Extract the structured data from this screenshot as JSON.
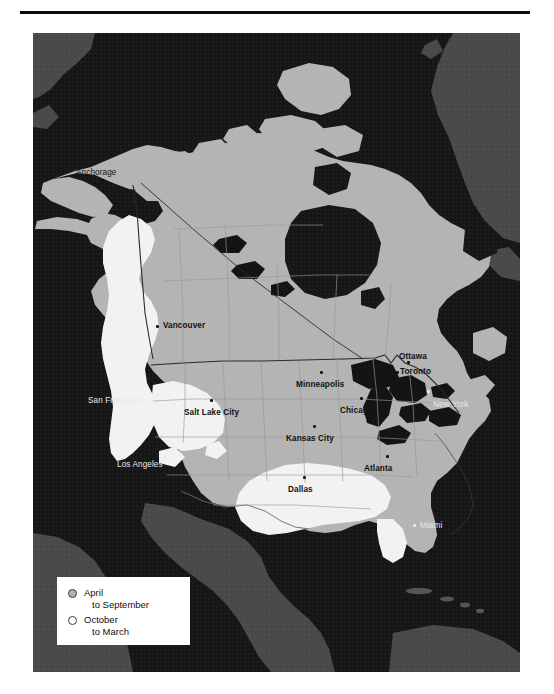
{
  "page": {
    "background_color": "#ffffff",
    "rule_color": "#0b0b0b"
  },
  "map": {
    "projection_note": "North America",
    "colors": {
      "ocean": "#171717",
      "land_other": "#4a4a4a",
      "land_main": "#b4b4b4",
      "season_april_september": "#b4b4b4",
      "season_october_march": "#f2f2f2",
      "lakes": "#141414",
      "border_line": "#2a2a2a",
      "state_line": "#9a9a9a"
    },
    "cities": [
      {
        "name": "Anchorage",
        "x": 76,
        "y": 168,
        "dot_x": 101,
        "dot_y": 179,
        "style": "on-land",
        "weight": "plainish"
      },
      {
        "name": "Vancouver",
        "x": 163,
        "y": 321,
        "dot_x": 156,
        "dot_y": 325,
        "style": "on-land",
        "weight": "bold"
      },
      {
        "name": "San Francisco",
        "x": 88,
        "y": 396,
        "dot_x": 156,
        "dot_y": 394,
        "style": "on-water",
        "weight": "plainish"
      },
      {
        "name": "Los Angeles",
        "x": 117,
        "y": 460,
        "dot_x": 163,
        "dot_y": 455,
        "style": "on-water",
        "weight": "plainish"
      },
      {
        "name": "Salt Lake City",
        "x": 184,
        "y": 408,
        "dot_x": 210,
        "dot_y": 399,
        "style": "on-land",
        "weight": "bold"
      },
      {
        "name": "Minneapolis",
        "x": 296,
        "y": 380,
        "dot_x": 320,
        "dot_y": 371,
        "style": "on-land",
        "weight": "bold"
      },
      {
        "name": "Chicago",
        "x": 340,
        "y": 406,
        "dot_x": 360,
        "dot_y": 397,
        "style": "on-land",
        "weight": "bold"
      },
      {
        "name": "Kansas City",
        "x": 286,
        "y": 434,
        "dot_x": 313,
        "dot_y": 425,
        "style": "on-land",
        "weight": "bold"
      },
      {
        "name": "Dallas",
        "x": 288,
        "y": 485,
        "dot_x": 303,
        "dot_y": 476,
        "style": "on-land",
        "weight": "bold"
      },
      {
        "name": "Atlanta",
        "x": 364,
        "y": 464,
        "dot_x": 386,
        "dot_y": 455,
        "style": "on-land",
        "weight": "bold"
      },
      {
        "name": "Ottawa",
        "x": 399,
        "y": 352,
        "dot_x": 407,
        "dot_y": 361,
        "style": "on-land",
        "weight": "bold"
      },
      {
        "name": "Toronto",
        "x": 400,
        "y": 367,
        "dot_x": 396,
        "dot_y": 371,
        "style": "on-land",
        "weight": "bold"
      },
      {
        "name": "New York",
        "x": 433,
        "y": 400,
        "dot_x": 427,
        "dot_y": 390,
        "style": "on-water",
        "weight": "plainish"
      },
      {
        "name": "Miami",
        "x": 420,
        "y": 521,
        "dot_x": 413,
        "dot_y": 524,
        "style": "on-water",
        "weight": "plainish"
      }
    ]
  },
  "legend": {
    "items": [
      {
        "swatch": "filled",
        "swatch_color": "#b3b3b3",
        "line1": "April",
        "line2": "to September"
      },
      {
        "swatch": "hollow",
        "swatch_color": "#ffffff",
        "line1": "October",
        "line2": "to March"
      }
    ]
  }
}
